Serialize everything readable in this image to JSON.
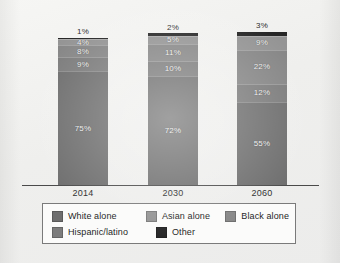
{
  "chart_data": {
    "type": "bar",
    "subtype": "stacked-100-percent",
    "title": "",
    "xlabel": "",
    "ylabel": "",
    "ylim": [
      0,
      100
    ],
    "grid": false,
    "legend_position": "bottom",
    "categories": [
      "2014",
      "2030",
      "2060"
    ],
    "stack_order_bottom_to_top": [
      "White alone",
      "Hispanic/latino",
      "Black alone",
      "Asian alone",
      "Other"
    ],
    "series": [
      {
        "name": "White alone",
        "color": "#6e6e6e",
        "values": [
          75,
          72,
          55
        ],
        "labels": [
          "75%",
          "72%",
          "55%"
        ]
      },
      {
        "name": "Hispanic/latino",
        "color": "#7c7c7c",
        "values": [
          9,
          10,
          12
        ],
        "labels": [
          "9%",
          "10%",
          "12%"
        ]
      },
      {
        "name": "Black alone",
        "color": "#868686",
        "values": [
          8,
          11,
          22
        ],
        "labels": [
          "8%",
          "11%",
          "22%"
        ]
      },
      {
        "name": "Asian alone",
        "color": "#949494",
        "values": [
          4,
          5,
          9
        ],
        "labels": [
          "4%",
          "5%",
          "9%"
        ]
      },
      {
        "name": "Other",
        "color": "#262626",
        "values": [
          1,
          2,
          3
        ],
        "labels": [
          "1%",
          "2%",
          "3%"
        ]
      }
    ]
  },
  "axis": {
    "years": [
      "2014",
      "2030",
      "2060"
    ]
  },
  "legend": {
    "rows": [
      [
        {
          "label": "White alone",
          "color": "#6e6e6e"
        },
        {
          "label": "Asian alone",
          "color": "#949494"
        },
        {
          "label": "Black alone",
          "color": "#868686"
        }
      ],
      [
        {
          "label": "Hispanic/latino",
          "color": "#7c7c7c"
        },
        {
          "label": "Other",
          "color": "#262626"
        }
      ]
    ]
  },
  "bars": {
    "2014": [
      {
        "series": "Other",
        "label": "1%",
        "value": 1,
        "color": "#262626"
      },
      {
        "series": "Asian alone",
        "label": "4%",
        "value": 4,
        "color": "#949494"
      },
      {
        "series": "Black alone",
        "label": "8%",
        "value": 8,
        "color": "#868686"
      },
      {
        "series": "Hispanic/latino",
        "label": "9%",
        "value": 9,
        "color": "#7c7c7c"
      },
      {
        "series": "White alone",
        "label": "75%",
        "value": 75,
        "color": "#6e6e6e"
      }
    ],
    "2030": [
      {
        "series": "Other",
        "label": "2%",
        "value": 2,
        "color": "#262626"
      },
      {
        "series": "Asian alone",
        "label": "5%",
        "value": 5,
        "color": "#949494"
      },
      {
        "series": "Black alone",
        "label": "11%",
        "value": 11,
        "color": "#868686"
      },
      {
        "series": "Hispanic/latino",
        "label": "10%",
        "value": 10,
        "color": "#7c7c7c"
      },
      {
        "series": "White alone",
        "label": "72%",
        "value": 72,
        "color": "#6e6e6e"
      }
    ],
    "2060": [
      {
        "series": "Other",
        "label": "3%",
        "value": 3,
        "color": "#262626"
      },
      {
        "series": "Asian alone",
        "label": "9%",
        "value": 9,
        "color": "#949494"
      },
      {
        "series": "Black alone",
        "label": "22%",
        "value": 22,
        "color": "#868686"
      },
      {
        "series": "Hispanic/latino",
        "label": "12%",
        "value": 12,
        "color": "#7c7c7c"
      },
      {
        "series": "White alone",
        "label": "55%",
        "value": 55,
        "color": "#6e6e6e"
      }
    ]
  }
}
